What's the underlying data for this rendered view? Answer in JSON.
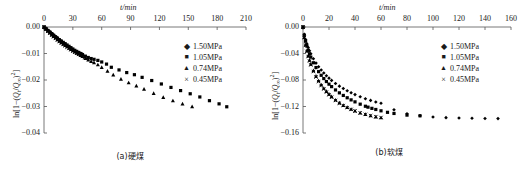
{
  "figure": {
    "panels": [
      {
        "id": "a",
        "caption": "(a)硬煤",
        "xaxis": {
          "title": "t/min",
          "ticks": [
            "0",
            "30",
            "60",
            "90",
            "120",
            "150",
            "180",
            "210"
          ],
          "min": 0,
          "max": 210,
          "step": 30
        },
        "yaxis": {
          "title": "ln[1−(Qt/Q∞)²]",
          "ticks": [
            "0.00",
            "−0.01",
            "−0.02",
            "−0.03",
            "−0.04"
          ],
          "min": -0.04,
          "max": 0.0,
          "step": 0.01
        },
        "legend": [
          {
            "marker": "diamond-marker",
            "glyph": "♦",
            "label": "1.50MPa"
          },
          {
            "marker": "square-marker",
            "glyph": "■",
            "label": "1.05MPa"
          },
          {
            "marker": "triangle-marker",
            "glyph": "▲",
            "label": "0.74MPa"
          },
          {
            "marker": "cross-marker",
            "glyph": "×",
            "label": "0.45MPa"
          }
        ]
      },
      {
        "id": "b",
        "caption": "(b)软煤",
        "xaxis": {
          "title": "t/min",
          "ticks": [
            "0",
            "20",
            "40",
            "60",
            "80",
            "100",
            "120",
            "140",
            "160"
          ],
          "min": 0,
          "max": 160,
          "step": 20
        },
        "yaxis": {
          "title": "ln[1−(Qt/Q∞)²]",
          "ticks": [
            "0.00",
            "−0.04",
            "−0.08",
            "−0.12",
            "−0.16"
          ],
          "min": -0.16,
          "max": 0.0,
          "step": 0.04
        },
        "legend": [
          {
            "marker": "diamond-marker",
            "glyph": "♦",
            "label": "1.50MPa"
          },
          {
            "marker": "square-marker",
            "glyph": "■",
            "label": "1.05MPa"
          },
          {
            "marker": "triangle-marker",
            "glyph": "▲",
            "label": "0.74MPa"
          },
          {
            "marker": "cross-marker",
            "glyph": "×",
            "label": "0.45MPa"
          }
        ]
      }
    ]
  },
  "chart_data": [
    {
      "type": "scatter",
      "title": "(a)硬煤",
      "xlabel": "t/min",
      "ylabel": "ln[1−(Qt/Q∞)²]",
      "xlim": [
        0,
        210
      ],
      "ylim": [
        -0.04,
        0.0
      ],
      "xticks": [
        0,
        30,
        60,
        90,
        120,
        150,
        180,
        210
      ],
      "yticks": [
        0.0,
        -0.01,
        -0.02,
        -0.03,
        -0.04
      ],
      "grid": false,
      "legend_position": "right-top",
      "axis_position": "x-top",
      "series": [
        {
          "name": "1.50MPa",
          "marker": "diamond",
          "color": "#000000",
          "x": [
            0,
            1,
            2,
            3,
            4,
            5,
            6,
            7,
            8,
            9,
            10,
            11,
            12,
            13,
            14,
            15,
            16,
            17,
            18,
            19,
            20,
            22,
            24,
            26,
            28,
            30,
            32,
            34,
            36,
            38,
            40
          ],
          "y": [
            0.0,
            -0.0003,
            -0.0006,
            -0.0009,
            -0.0012,
            -0.0015,
            -0.0018,
            -0.0021,
            -0.0024,
            -0.0027,
            -0.003,
            -0.0033,
            -0.0036,
            -0.0039,
            -0.0042,
            -0.0045,
            -0.0048,
            -0.0051,
            -0.0054,
            -0.0057,
            -0.006,
            -0.0065,
            -0.007,
            -0.0075,
            -0.008,
            -0.0085,
            -0.0089,
            -0.0093,
            -0.0096,
            -0.0099,
            -0.0102
          ]
        },
        {
          "name": "1.05MPa",
          "marker": "square",
          "color": "#000000",
          "x": [
            0,
            2,
            4,
            6,
            8,
            10,
            12,
            14,
            16,
            18,
            20,
            22,
            24,
            26,
            28,
            30,
            32,
            34,
            36,
            38,
            40,
            43,
            46,
            49,
            52,
            56,
            60,
            65,
            70,
            78,
            86,
            94,
            102,
            112,
            122,
            132,
            142,
            152,
            162,
            172,
            182,
            190
          ],
          "y": [
            0.0,
            -0.0007,
            -0.0013,
            -0.0019,
            -0.0025,
            -0.0031,
            -0.0037,
            -0.0042,
            -0.0048,
            -0.0053,
            -0.0058,
            -0.0063,
            -0.0068,
            -0.0073,
            -0.0078,
            -0.0083,
            -0.0088,
            -0.0092,
            -0.0096,
            -0.01,
            -0.0104,
            -0.011,
            -0.0115,
            -0.0119,
            -0.0122,
            -0.0126,
            -0.0132,
            -0.014,
            -0.0152,
            -0.0162,
            -0.0172,
            -0.018,
            -0.019,
            -0.0202,
            -0.0215,
            -0.0228,
            -0.024,
            -0.0252,
            -0.0264,
            -0.0278,
            -0.029,
            -0.0301
          ]
        },
        {
          "name": "0.74MPa",
          "marker": "triangle",
          "color": "#000000",
          "x": [
            0,
            2,
            4,
            6,
            8,
            10,
            12,
            14,
            16,
            18,
            20,
            22,
            24,
            26,
            28,
            30,
            32,
            34,
            36,
            38,
            40,
            43,
            46,
            49,
            52,
            56,
            60,
            66,
            72,
            80,
            88,
            96,
            104,
            114,
            124,
            134,
            144,
            154
          ],
          "y": [
            0.0,
            -0.0008,
            -0.0015,
            -0.0022,
            -0.0029,
            -0.0035,
            -0.0041,
            -0.0047,
            -0.0053,
            -0.0059,
            -0.0064,
            -0.0069,
            -0.0074,
            -0.0079,
            -0.0084,
            -0.0089,
            -0.0094,
            -0.0098,
            -0.0102,
            -0.0107,
            -0.0111,
            -0.0118,
            -0.0124,
            -0.0129,
            -0.0134,
            -0.0142,
            -0.0152,
            -0.0166,
            -0.018,
            -0.0196,
            -0.021,
            -0.0222,
            -0.0234,
            -0.025,
            -0.0265,
            -0.0278,
            -0.029,
            -0.03
          ]
        },
        {
          "name": "0.45MPa",
          "marker": "cross",
          "color": "#000000",
          "x": [
            0,
            2,
            4,
            6,
            8,
            10,
            12,
            14,
            16,
            18,
            20,
            22,
            24,
            26,
            28,
            30,
            32,
            34,
            36,
            38,
            40,
            42,
            44
          ],
          "y": [
            0.0,
            -0.0008,
            -0.0016,
            -0.0023,
            -0.003,
            -0.0037,
            -0.0043,
            -0.0049,
            -0.0055,
            -0.0061,
            -0.0066,
            -0.0071,
            -0.0076,
            -0.0081,
            -0.0086,
            -0.0091,
            -0.0095,
            -0.0099,
            -0.0103,
            -0.0107,
            -0.0111,
            -0.0115,
            -0.0118
          ]
        }
      ]
    },
    {
      "type": "scatter",
      "title": "(b)软煤",
      "xlabel": "t/min",
      "ylabel": "ln[1−(Qt/Q∞)²]",
      "xlim": [
        0,
        160
      ],
      "ylim": [
        -0.16,
        0.0
      ],
      "xticks": [
        0,
        20,
        40,
        60,
        80,
        100,
        120,
        140,
        160
      ],
      "yticks": [
        0.0,
        -0.04,
        -0.08,
        -0.12,
        -0.16
      ],
      "grid": false,
      "legend_position": "right-top",
      "axis_position": "x-top",
      "series": [
        {
          "name": "1.50MPa",
          "marker": "diamond",
          "color": "#000000",
          "x": [
            0,
            1,
            2,
            3,
            4,
            5,
            6,
            8,
            10,
            12,
            14,
            16,
            18,
            20,
            22,
            25,
            28,
            31,
            34,
            37,
            40,
            44,
            48,
            52,
            56,
            60,
            70,
            80,
            90,
            100,
            110,
            120,
            130,
            140,
            150
          ],
          "y": [
            0.0,
            -0.011,
            -0.019,
            -0.0255,
            -0.031,
            -0.036,
            -0.0405,
            -0.048,
            -0.0545,
            -0.06,
            -0.065,
            -0.0695,
            -0.0735,
            -0.0772,
            -0.0806,
            -0.0852,
            -0.0893,
            -0.0929,
            -0.0962,
            -0.0992,
            -0.102,
            -0.1053,
            -0.1082,
            -0.1108,
            -0.1131,
            -0.1152,
            -0.125,
            -0.131,
            -0.134,
            -0.1358,
            -0.1368,
            -0.1374,
            -0.1378,
            -0.1381,
            -0.1383
          ]
        },
        {
          "name": "1.05MPa",
          "marker": "square",
          "color": "#000000",
          "x": [
            0,
            1,
            2,
            3,
            4,
            5,
            6,
            8,
            10,
            12,
            14,
            16,
            18,
            20,
            22,
            25,
            28,
            31,
            34,
            37,
            40,
            44,
            48,
            50,
            53,
            56,
            60,
            65,
            70,
            80,
            90
          ],
          "y": [
            0.0,
            -0.0125,
            -0.0215,
            -0.0288,
            -0.035,
            -0.0405,
            -0.0455,
            -0.054,
            -0.0612,
            -0.0674,
            -0.0729,
            -0.0778,
            -0.0823,
            -0.0863,
            -0.09,
            -0.095,
            -0.0994,
            -0.1033,
            -0.1068,
            -0.11,
            -0.113,
            -0.1165,
            -0.1196,
            -0.121,
            -0.1228,
            -0.1245,
            -0.1265,
            -0.1288,
            -0.1305,
            -0.133,
            -0.134
          ]
        },
        {
          "name": "0.74MPa",
          "marker": "triangle",
          "color": "#000000",
          "x": [
            0,
            1,
            2,
            3,
            4,
            5,
            6,
            8,
            10,
            12,
            14,
            16,
            18,
            20,
            22,
            25,
            28,
            31,
            34,
            37,
            40,
            44,
            48,
            52,
            56,
            60
          ],
          "y": [
            0.0,
            -0.0155,
            -0.0268,
            -0.0358,
            -0.0434,
            -0.05,
            -0.0558,
            -0.0658,
            -0.074,
            -0.081,
            -0.087,
            -0.0923,
            -0.097,
            -0.1012,
            -0.105,
            -0.11,
            -0.1143,
            -0.118,
            -0.1212,
            -0.124,
            -0.1265,
            -0.1294,
            -0.1318,
            -0.1338,
            -0.1354,
            -0.1368
          ]
        },
        {
          "name": "0.45MPa",
          "marker": "cross",
          "color": "#000000",
          "x": [
            0,
            1,
            2,
            3,
            4,
            5,
            6,
            8,
            10,
            12,
            14,
            16,
            18,
            20,
            22,
            25,
            28,
            31,
            34,
            37,
            40,
            44,
            48,
            52,
            56,
            60
          ],
          "y": [
            0.0,
            -0.016,
            -0.0275,
            -0.0368,
            -0.0446,
            -0.0513,
            -0.0572,
            -0.0672,
            -0.0755,
            -0.0824,
            -0.0884,
            -0.0936,
            -0.0982,
            -0.1023,
            -0.106,
            -0.1109,
            -0.115,
            -0.1186,
            -0.1217,
            -0.1244,
            -0.1268,
            -0.1296,
            -0.1319,
            -0.1338,
            -0.1353,
            -0.1366
          ]
        }
      ]
    }
  ]
}
